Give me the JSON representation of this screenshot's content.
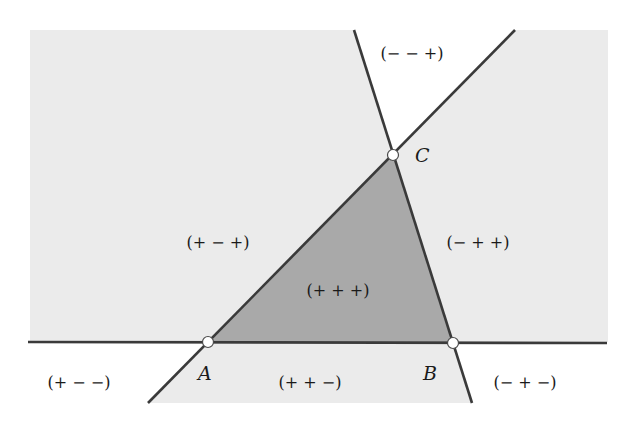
{
  "diagram": {
    "colors": {
      "background": "#ffffff",
      "light_region": "#ebebeb",
      "triangle_fill": "#a9a9a9",
      "line": "#3a3a3a",
      "point_fill": "#ffffff",
      "point_stroke": "#4a4a4a"
    },
    "vertices": [
      {
        "name": "A",
        "label": "A",
        "x": 208,
        "y": 342,
        "label_x": 198,
        "label_y": 380
      },
      {
        "name": "B",
        "label": "B",
        "x": 453,
        "y": 343,
        "label_x": 423,
        "label_y": 380
      },
      {
        "name": "C",
        "label": "C",
        "x": 393,
        "y": 155,
        "label_x": 415,
        "label_y": 162
      }
    ],
    "regions": [
      {
        "id": "ppp",
        "label": "(+ + +)",
        "x": 338,
        "y": 296
      },
      {
        "id": "pmp",
        "label": "(+ − +)",
        "x": 218,
        "y": 248
      },
      {
        "id": "mpp",
        "label": "(− + +)",
        "x": 478,
        "y": 248
      },
      {
        "id": "mmp",
        "label": "(− − +)",
        "x": 412,
        "y": 59
      },
      {
        "id": "ppm",
        "label": "(+ + −)",
        "x": 310,
        "y": 388
      },
      {
        "id": "pmm",
        "label": "(+ − −)",
        "x": 79,
        "y": 388
      },
      {
        "id": "mpm",
        "label": "(− + −)",
        "x": 525,
        "y": 388
      }
    ]
  }
}
